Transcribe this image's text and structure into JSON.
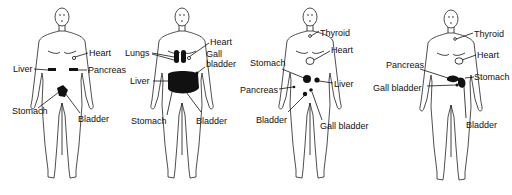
{
  "figures": [
    {
      "id": "figure-1",
      "labels": {
        "heart": "Heart",
        "liver": "Liver",
        "pancreas": "Pancreas",
        "stomach": "Stomach",
        "bladder": "Bladder"
      }
    },
    {
      "id": "figure-2",
      "labels": {
        "lungs": "Lungs",
        "heart": "Heart",
        "gall": "Gall",
        "bladder_gb": "bladder",
        "liver": "Liver",
        "stomach": "Stomach",
        "bladder": "Bladder"
      }
    },
    {
      "id": "figure-3",
      "labels": {
        "thyroid": "Thyroid",
        "heart": "Heart",
        "stomach": "Stomach",
        "pancreas": "Pancreas",
        "liver": "Liver",
        "bladder": "Bladder",
        "gall_bladder": "Gall bladder"
      }
    },
    {
      "id": "figure-4",
      "labels": {
        "thyroid": "Thyroid",
        "heart": "Heart",
        "pancreas": "Pancreas",
        "stomach": "Stomach",
        "gall_bladder": "Gall bladder",
        "bladder": "Bladder"
      }
    }
  ]
}
